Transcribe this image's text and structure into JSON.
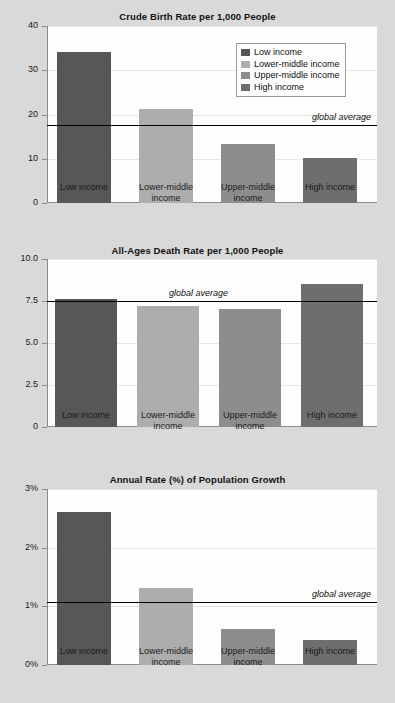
{
  "categories": [
    "Low income",
    "Lower-middle income",
    "Upper-middle income",
    "High income"
  ],
  "category_axis_labels": [
    "Low income",
    "Lower-middle\nincome",
    "Upper-middle\nincome",
    "High income"
  ],
  "series_colors": [
    "#575757",
    "#adadad",
    "#8d8d8d",
    "#6e6e6e"
  ],
  "legend": {
    "items": [
      {
        "label": "Low income",
        "color": "#575757"
      },
      {
        "label": "Lower-middle income",
        "color": "#adadad"
      },
      {
        "label": "Upper-middle income",
        "color": "#8d8d8d"
      },
      {
        "label": "High income",
        "color": "#6e6e6e"
      }
    ]
  },
  "average_label": "global average",
  "chart_data": [
    {
      "type": "bar",
      "title": "Crude Birth Rate per 1,000 People",
      "xlabel": "",
      "ylabel": "",
      "categories": [
        "Low income",
        "Lower-middle income",
        "Upper-middle income",
        "High income"
      ],
      "values": [
        34.2,
        21.2,
        13.4,
        10.1
      ],
      "ylim": [
        0,
        40
      ],
      "yticks": [
        0,
        10,
        20,
        30,
        40
      ],
      "ytick_labels": [
        "0",
        "10",
        "20",
        "30",
        "40"
      ],
      "grid": true,
      "legend_position": "upper right",
      "annotations": [
        {
          "type": "hline",
          "label": "global average",
          "value": 17.7
        }
      ]
    },
    {
      "type": "bar",
      "title": "All-Ages Death Rate per 1,000 People",
      "xlabel": "",
      "ylabel": "",
      "categories": [
        "Low income",
        "Lower-middle income",
        "Upper-middle income",
        "High income"
      ],
      "values": [
        7.6,
        7.2,
        7.0,
        8.5
      ],
      "ylim": [
        0,
        10
      ],
      "yticks": [
        0,
        2.5,
        5.0,
        7.5,
        10.0
      ],
      "ytick_labels": [
        "0",
        "2.5",
        "5.0",
        "7.5",
        "10.0"
      ],
      "grid": true,
      "legend_position": "none",
      "annotations": [
        {
          "type": "hline",
          "label": "global average",
          "value": 7.5
        }
      ]
    },
    {
      "type": "bar",
      "title": "Annual Rate (%) of Population Growth",
      "xlabel": "",
      "ylabel": "",
      "categories": [
        "Low income",
        "Lower-middle income",
        "Upper-middle income",
        "High income"
      ],
      "values": [
        2.6,
        1.32,
        0.62,
        0.42
      ],
      "ylim": [
        0,
        3
      ],
      "yticks": [
        0,
        1,
        2,
        3
      ],
      "ytick_labels": [
        "0%",
        "1%",
        "2%",
        "3%"
      ],
      "grid": true,
      "legend_position": "none",
      "annotations": [
        {
          "type": "hline",
          "label": "global average",
          "value": 1.08
        }
      ]
    }
  ]
}
